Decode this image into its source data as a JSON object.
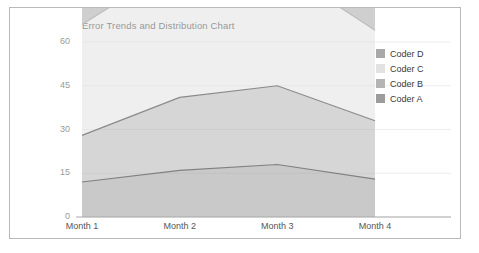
{
  "chart": {
    "title": "Error Trends and Distribution Chart",
    "frame_border_color": "#b9b9b9",
    "background": "#ffffff"
  },
  "axes": {
    "y_ticks": [
      "0",
      "15",
      "30",
      "45",
      "60"
    ],
    "x_ticks": [
      "Month 1",
      "Month 2",
      "Month 3",
      "Month 4"
    ],
    "tick_color": "#9a9a9a",
    "axis_line_color": "#aaaaaa",
    "grid_color": "#ededed"
  },
  "legend": {
    "position": "right",
    "items": [
      {
        "label": "Coder D",
        "color": "#a8a8a8"
      },
      {
        "label": "Coder C",
        "color": "#e2e2e2"
      },
      {
        "label": "Coder B",
        "color": "#b4b4b4"
      },
      {
        "label": "Coder A",
        "color": "#9c9c9c"
      }
    ]
  },
  "chart_data": {
    "type": "area",
    "title": "Error Trends and Distribution Chart",
    "xlabel": "",
    "ylabel": "",
    "categories": [
      "Month 1",
      "Month 2",
      "Month 3",
      "Month 4"
    ],
    "ylim": [
      0,
      60
    ],
    "yticks": [
      0,
      15,
      30,
      45,
      60
    ],
    "grid": true,
    "stacked": true,
    "legend_position": "right",
    "series": [
      {
        "name": "Coder A",
        "values": [
          12,
          16,
          18,
          13
        ],
        "color": "#9c9c9c",
        "line_color": "#808080"
      },
      {
        "name": "Coder B",
        "values": [
          16,
          25,
          27,
          20
        ],
        "color": "#b4b4b4",
        "line_color": "#8a8a8a"
      },
      {
        "name": "Coder C",
        "values": [
          38,
          46,
          41,
          31
        ],
        "color": "#e2e2e2",
        "line_color": "#bdbdbd"
      },
      {
        "name": "Coder D",
        "values": [
          51,
          57,
          53,
          47
        ],
        "color": "#a8a8a8",
        "line_color": "#9a9a9a"
      }
    ]
  }
}
